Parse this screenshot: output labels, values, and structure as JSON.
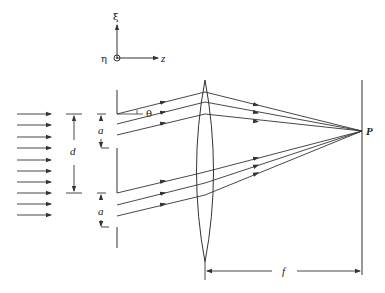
{
  "figure": {
    "axes": {
      "vertical_label": "ξ",
      "out_of_page_label": "η",
      "horizontal_label": "z"
    },
    "labels": {
      "slit_width_top": "a",
      "slit_width_bottom": "a",
      "slit_separation": "d",
      "angle": "θ",
      "focal_point": "P",
      "focal_length": "f"
    },
    "incident_arrows_count": 10,
    "colors": {
      "line": "#333333",
      "background": "#ffffff"
    }
  }
}
